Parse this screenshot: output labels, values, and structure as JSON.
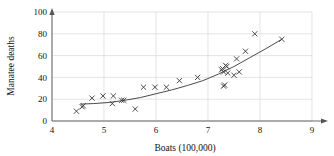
{
  "chart_data": {
    "type": "scatter",
    "title": "",
    "xlabel": "Boats (100,000)",
    "ylabel": "Manatee deaths",
    "xlim": [
      4,
      9
    ],
    "ylim": [
      0,
      100
    ],
    "xticks": [
      "4",
      "5",
      "6",
      "7",
      "8",
      "9"
    ],
    "yticks": [
      "0",
      "20",
      "40",
      "60",
      "80",
      "100"
    ],
    "grid": true,
    "legend": "none",
    "marker": "x",
    "series": [
      {
        "name": "Manatee deaths vs boats",
        "points": [
          [
            4.47,
            9
          ],
          [
            4.58,
            13
          ],
          [
            4.6,
            14
          ],
          [
            4.77,
            21
          ],
          [
            4.98,
            23
          ],
          [
            5.16,
            16
          ],
          [
            5.18,
            23
          ],
          [
            5.34,
            19
          ],
          [
            5.38,
            19
          ],
          [
            5.6,
            11
          ],
          [
            5.76,
            31
          ],
          [
            5.98,
            31
          ],
          [
            6.2,
            31
          ],
          [
            6.45,
            37
          ],
          [
            6.8,
            40
          ],
          [
            7.26,
            47
          ],
          [
            7.28,
            48
          ],
          [
            7.3,
            45
          ],
          [
            7.3,
            32
          ],
          [
            7.32,
            33
          ],
          [
            7.34,
            51
          ],
          [
            7.36,
            50
          ],
          [
            7.38,
            44
          ],
          [
            7.5,
            42
          ],
          [
            7.55,
            57
          ],
          [
            7.6,
            45
          ],
          [
            7.72,
            64
          ],
          [
            7.9,
            80
          ],
          [
            8.42,
            75
          ]
        ]
      }
    ],
    "fit_curve": {
      "name": "smoothed trend",
      "points": [
        [
          4.55,
          15.5
        ],
        [
          4.8,
          16.0
        ],
        [
          5.1,
          17.0
        ],
        [
          5.4,
          19.0
        ],
        [
          5.7,
          21.5
        ],
        [
          6.0,
          25.0
        ],
        [
          6.3,
          28.5
        ],
        [
          6.6,
          32.5
        ],
        [
          6.9,
          37.0
        ],
        [
          7.2,
          43.0
        ],
        [
          7.5,
          50.0
        ],
        [
          7.8,
          58.0
        ],
        [
          8.1,
          66.0
        ],
        [
          8.42,
          75.0
        ]
      ]
    }
  },
  "axes": {
    "x_label": "Boats (100,000)",
    "y_label": "Manatee deaths",
    "x_tick_labels": [
      "4",
      "5",
      "6",
      "7",
      "8",
      "9"
    ],
    "y_tick_labels": [
      "0",
      "20",
      "40",
      "60",
      "80",
      "100"
    ]
  },
  "colors": {
    "marker": "#3a3a3a",
    "curve": "#4a4a4a",
    "grid": "#d9d9d9",
    "axis": "#555555",
    "text": "#111111",
    "background": "#ffffff"
  }
}
